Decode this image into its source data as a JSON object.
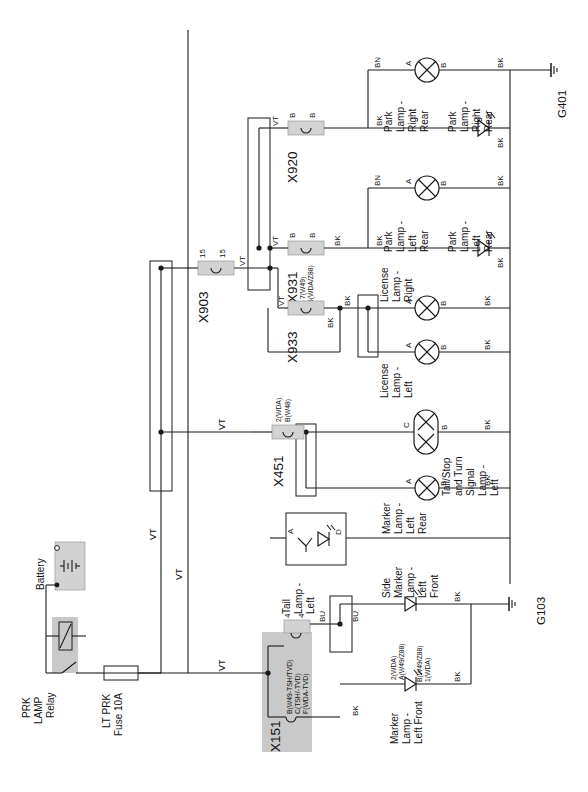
{
  "diagram": {
    "orientation": "text rotated 90 degrees counter-clockwise",
    "sheet_size": "588x792"
  },
  "power": {
    "battery_label": "Battery",
    "relay_label": "PRK\nLAMP\nRelay",
    "relay_label_l1": "PRK",
    "relay_label_l2": "LAMP",
    "relay_label_l3": "Relay",
    "fuse_label_l1": "LT PRK",
    "fuse_label_l2": "Fuse 10A"
  },
  "connectors": [
    {
      "name": "X903",
      "pin_left": "15",
      "pin_right": "15",
      "wire_out": "VT"
    },
    {
      "name": "X920",
      "pin_left": "B",
      "pin_right": "B",
      "wire_out": "VT"
    },
    {
      "name": "X931",
      "pin_left": "B",
      "pin_right": "B",
      "wire_out": "VT",
      "sub_left": "7(W49)",
      "sub_right": "5(WDA/Z88)"
    },
    {
      "name": "X933",
      "pin_left": "",
      "pin_right": "",
      "wire_out": "VT"
    },
    {
      "name": "X451",
      "pin_left": "2(WDA)",
      "pin_right": "B(W48)",
      "wire_out": "VT"
    },
    {
      "name": "X151",
      "pin_left": "4",
      "pin_right": "4",
      "wire_out": "BU",
      "sub_rows": [
        "B(W49-TSH/TVD)",
        "C(TSH/-TVD)",
        "F(WDA-TVD)"
      ]
    }
  ],
  "connector_names": {
    "x903": "X903",
    "x920": "X920",
    "x931": "X931",
    "x933": "X933",
    "x451": "X451",
    "x151": "X151"
  },
  "connector_pins": {
    "x903_l": "15",
    "x903_r": "15",
    "x920_l": "B",
    "x920_r": "B",
    "x931_l": "B",
    "x931_r": "B",
    "x931_sub_l": "7(W49)",
    "x931_sub_r": "5(WDA/Z88)",
    "x451_sub_l": "2(WDA)",
    "x451_sub_r": "B(W48)",
    "x151_l": "4",
    "x151_r": "4",
    "x151_row1": "B(W49-TSH/TVD)",
    "x151_row2": "C(TSH/-TVD)",
    "x151_row3": "F(WDA-TVD)"
  },
  "components": [
    {
      "id": "park-right-rear-bulb",
      "label": "Park\nLamp -\nRight\nRear",
      "type": "bulb",
      "pin_in": "A",
      "pin_out": "B",
      "wire_in": "BN",
      "wire_out": "BK"
    },
    {
      "id": "park-right-rear-led",
      "label": "Park\nLamp -\nRight\nRear",
      "type": "led",
      "wire_in": "BK",
      "wire_out": "BK"
    },
    {
      "id": "park-left-rear-bulb",
      "label": "Park\nLamp -\nLeft\nRear",
      "type": "bulb",
      "pin_in": "A",
      "pin_out": "B",
      "wire_in": "BN",
      "wire_out": "BK"
    },
    {
      "id": "park-left-rear-led",
      "label": "Park\nLamp -\nLeft\nRear",
      "type": "led",
      "wire_in": "BK",
      "wire_out": "BK"
    },
    {
      "id": "license-right",
      "label": "License\nLamp -\nRight",
      "type": "bulb",
      "pin_in": "A",
      "pin_out": "B",
      "wire_out": "BK"
    },
    {
      "id": "license-left",
      "label": "License\nLamp -\nLeft",
      "type": "bulb",
      "pin_in": "A",
      "pin_out": "B",
      "wire_out": "BK"
    },
    {
      "id": "tail-stop-turn-left",
      "label": "Tail/Stop\nand Turn\nSignal\nLamp -\nLeft",
      "type": "dual-bulb",
      "pin_in": "C",
      "pin_out": "B",
      "wire_out": "BK"
    },
    {
      "id": "marker-left-rear",
      "label": "Marker\nLamp -\nLeft\nRear",
      "type": "bulb",
      "pin_in": "A",
      "pin_out": "B",
      "wire_out": "BK"
    },
    {
      "id": "tail-lamp-left",
      "label": "Tail\nLamp -\nLeft",
      "type": "module-led",
      "pin_in": "A",
      "pin_out": "D"
    },
    {
      "id": "side-marker-left-front",
      "label": "Side\nMarker\nLamp -\nLeft\nFront",
      "type": "led",
      "wire_out": "BK"
    },
    {
      "id": "marker-left-front",
      "label": "Marker\nLamp -\nLeft Front",
      "type": "led",
      "pin_in_top": "2(WDA)",
      "pin_in_bot": "A(W49/Z88)",
      "pin_out_top": "B(W49/Z88)",
      "pin_out_bot": "1(WDA)",
      "wire_out": "BK"
    }
  ],
  "component_labels": {
    "park_rr_bulb_1": "Park",
    "park_rr_bulb_2": "Lamp -",
    "park_rr_bulb_3": "Right",
    "park_rr_bulb_4": "Rear",
    "park_rr_led_1": "Park",
    "park_rr_led_2": "Lamp -",
    "park_rr_led_3": "Right",
    "park_rr_led_4": "Rear",
    "park_lr_bulb_1": "Park",
    "park_lr_bulb_2": "Lamp -",
    "park_lr_bulb_3": "Left",
    "park_lr_bulb_4": "Rear",
    "park_lr_led_1": "Park",
    "park_lr_led_2": "Lamp -",
    "park_lr_led_3": "Left",
    "park_lr_led_4": "Rear",
    "lic_r_1": "License",
    "lic_r_2": "Lamp -",
    "lic_r_3": "Right",
    "lic_l_1": "License",
    "lic_l_2": "Lamp -",
    "lic_l_3": "Left",
    "tsts_1": "Tail/Stop",
    "tsts_2": "and Turn",
    "tsts_3": "Signal",
    "tsts_4": "Lamp -",
    "tsts_5": "Left",
    "mlr_1": "Marker",
    "mlr_2": "Lamp -",
    "mlr_3": "Left",
    "mlr_4": "Rear",
    "tll_1": "Tail",
    "tll_2": "Lamp -",
    "tll_3": "Left",
    "smlf_1": "Side",
    "smlf_2": "Marker",
    "smlf_3": "Lamp -",
    "smlf_4": "Left",
    "smlf_5": "Front",
    "mlf_1": "Marker",
    "mlf_2": "Lamp -",
    "mlf_3": "Left Front",
    "mlf_p1": "2(WDA)",
    "mlf_p2": "A(W49/Z88)",
    "mlf_p3": "B(W49/Z88)",
    "mlf_p4": "1(WDA)"
  },
  "pins": {
    "A": "A",
    "B": "B",
    "C": "C",
    "D": "D"
  },
  "wire_colors": {
    "vt": "VT",
    "bk": "BK",
    "bn": "BN",
    "bu": "BU"
  },
  "grounds": [
    {
      "name": "G401"
    },
    {
      "name": "G103"
    }
  ],
  "ground_names": {
    "g401": "G401",
    "g103": "G103"
  },
  "colors": {
    "line": "#1a1a1a",
    "shade": "#c9c9c9",
    "background": "#ffffff"
  }
}
